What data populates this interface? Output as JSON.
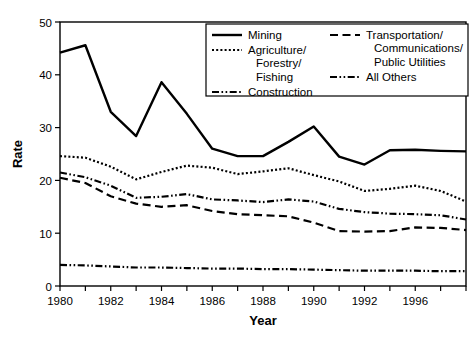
{
  "chart_data": {
    "type": "line",
    "title": "",
    "xlabel": "Year",
    "ylabel": "Rate",
    "xlim": [
      1980,
      1996
    ],
    "ylim": [
      0,
      50
    ],
    "grid": false,
    "legend_position": "top-right",
    "x": [
      1980,
      1981,
      1982,
      1983,
      1984,
      1985,
      1986,
      1987,
      1988,
      1989,
      1990,
      1991,
      1992,
      1993,
      1994,
      1995,
      1996
    ],
    "xticks": [
      1980,
      1981,
      1982,
      1983,
      1984,
      1985,
      1986,
      1987,
      1988,
      1989,
      1990,
      1991,
      1992,
      1993,
      1994,
      1995,
      1996
    ],
    "xtick_labels": [
      "1980",
      "",
      "1982",
      "",
      "1984",
      "",
      "1986",
      "",
      "1988",
      "",
      "1990",
      "",
      "1992",
      "",
      "1996",
      "",
      ""
    ],
    "yticks": [
      0,
      10,
      20,
      30,
      40,
      50
    ],
    "ytick_labels": [
      "0",
      "10",
      "20",
      "30",
      "40",
      "50"
    ],
    "series": [
      {
        "name": "Mining",
        "style": "solid",
        "values": [
          44.2,
          45.6,
          33.0,
          28.4,
          38.6,
          32.6,
          26.0,
          24.6,
          24.6,
          27.3,
          30.2,
          24.5,
          23.0,
          25.7,
          25.8,
          25.6,
          25.5
        ]
      },
      {
        "name": "Agriculture/ Forestry/ Fishing",
        "style": "dotted",
        "values": [
          24.6,
          24.3,
          22.6,
          20.2,
          21.6,
          22.8,
          22.4,
          21.2,
          21.7,
          22.3,
          21.0,
          19.8,
          18.0,
          18.4,
          19.0,
          18.0,
          16.0
        ]
      },
      {
        "name": "Construction",
        "style": "dash-dot-dot",
        "values": [
          21.5,
          20.6,
          19.0,
          16.7,
          16.9,
          17.4,
          16.4,
          16.2,
          15.9,
          16.4,
          16.0,
          14.6,
          14.0,
          13.7,
          13.6,
          13.4,
          12.6
        ]
      },
      {
        "name": "Transportation/ Communications/ Public Utilities",
        "style": "dashed",
        "values": [
          20.5,
          19.5,
          17.0,
          15.6,
          15.0,
          15.3,
          14.2,
          13.6,
          13.4,
          13.2,
          12.0,
          10.4,
          10.3,
          10.4,
          11.1,
          11.0,
          10.6
        ]
      },
      {
        "name": "All Others",
        "style": "dash-dot-dot",
        "values": [
          4.0,
          3.9,
          3.7,
          3.5,
          3.5,
          3.4,
          3.3,
          3.3,
          3.2,
          3.2,
          3.1,
          3.0,
          2.9,
          2.9,
          2.9,
          2.8,
          2.8
        ]
      }
    ]
  },
  "legend": {
    "entries": [
      {
        "label": "Mining",
        "style": "solid",
        "column": "left"
      },
      {
        "label": "Agriculture/",
        "label2": "Forestry/",
        "label3": "Fishing",
        "style": "dotted",
        "column": "left"
      },
      {
        "label": "Construction",
        "style": "dash-dot-dot",
        "column": "left"
      },
      {
        "label": "Transportation/",
        "label2": "Communications/",
        "label3": "Public Utilities",
        "style": "dashed",
        "column": "right"
      },
      {
        "label": "All Others",
        "style": "dash-dot-dot",
        "column": "right"
      }
    ]
  },
  "colors": {
    "line": "#000000",
    "background": "#ffffff",
    "text": "#000000"
  }
}
